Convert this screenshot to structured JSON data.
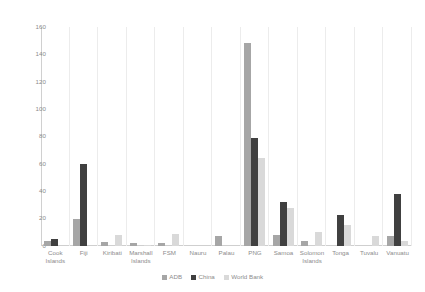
{
  "chart_data": {
    "type": "bar",
    "title": "",
    "xlabel": "",
    "ylabel": "",
    "ylim": [
      0,
      160
    ],
    "yticks": [
      0,
      20,
      40,
      60,
      80,
      100,
      120,
      140,
      160
    ],
    "grid": "vertical-category-separators-only",
    "legend_position": "bottom-right",
    "categories": [
      "Cook Islands",
      "Fiji",
      "Kiribati",
      "Marshall Islands",
      "FSM",
      "Nauru",
      "Palau",
      "PNG",
      "Samoa",
      "Solomon Islands",
      "Tonga",
      "Tuvalu",
      "Vanuatu"
    ],
    "series": [
      {
        "name": "ADB",
        "color": "#a6a6a6",
        "values": [
          4,
          20,
          3,
          2,
          2,
          0,
          7,
          148,
          8,
          4,
          0,
          0,
          7
        ]
      },
      {
        "name": "China",
        "color": "#404040",
        "values": [
          5,
          60,
          0,
          0,
          0,
          0,
          0,
          79,
          32,
          0,
          23,
          0,
          38
        ]
      },
      {
        "name": "World Bank",
        "color": "#d9d9d9",
        "values": [
          0,
          0,
          8,
          1,
          9,
          0,
          0,
          64,
          28,
          10,
          15,
          7,
          4
        ]
      }
    ]
  },
  "legend": {
    "items": [
      {
        "label": "ADB",
        "color": "#a6a6a6"
      },
      {
        "label": "China",
        "color": "#404040"
      },
      {
        "label": "World Bank",
        "color": "#d9d9d9"
      }
    ]
  }
}
